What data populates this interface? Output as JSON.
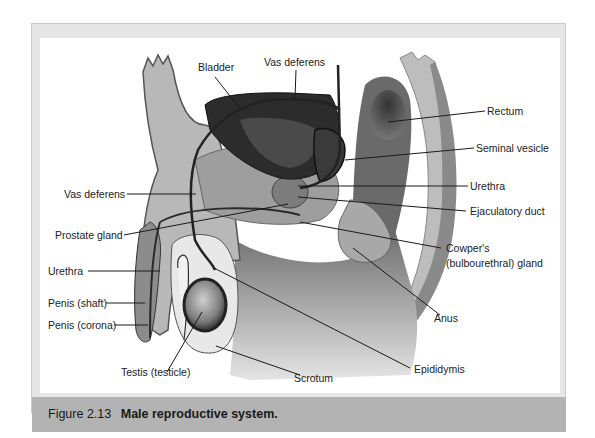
{
  "figure": {
    "number": "Figure 2.13",
    "title": "Male reproductive system."
  },
  "labels": {
    "bladder": "Bladder",
    "vas_deferens_top": "Vas deferens",
    "rectum": "Rectum",
    "seminal_vesicle": "Seminal vesicle",
    "urethra_right": "Urethra",
    "ejaculatory_duct": "Ejaculatory duct",
    "cowpers_line1": "Cowper's",
    "cowpers_line2": "(bulbourethral) gland",
    "anus": "Anus",
    "epididymis": "Epididymis",
    "scrotum": "Scrotum",
    "testis": "Testis (testicle)",
    "vas_deferens_left": "Vas deferens",
    "prostate_gland": "Prostate gland",
    "urethra_left": "Urethra",
    "penis_shaft": "Penis (shaft)",
    "penis_corona": "Penis (corona)"
  },
  "colors": {
    "frame": "#e6e6e6",
    "caption_bar": "#b3b3b3",
    "tissue_light": "#c8c8c8",
    "tissue_mid": "#9a9a9a",
    "tissue_dark": "#3a3a3a",
    "leader_line": "#1a1a1a"
  }
}
